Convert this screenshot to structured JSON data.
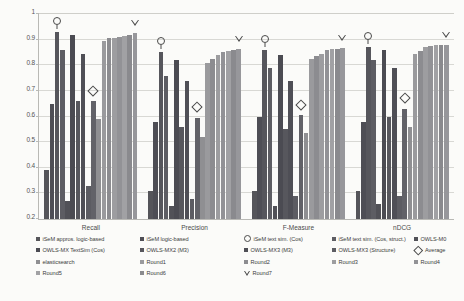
{
  "chart_data": {
    "type": "bar",
    "title": "",
    "xlabel": "",
    "ylabel": "",
    "ylim": [
      0.2,
      1
    ],
    "yticks": [
      "0.2",
      "0.3",
      "0.4",
      "0.5",
      "0.6",
      "0.7",
      "0.8",
      "0.9",
      "1"
    ],
    "grid": true,
    "legend_position": "bottom",
    "categories": [
      "Recall",
      "Precision",
      "F-Measure",
      "nDCG"
    ],
    "series": [
      {
        "name": "iSeM appros. logic-based",
        "color": "#55555a",
        "marker": "bar",
        "values": [
          0.39,
          0.31,
          0.31,
          0.31
        ]
      },
      {
        "name": "iSeM logic-based",
        "color": "#4e4e55",
        "marker": "bar",
        "values": [
          0.65,
          0.58,
          0.6,
          0.58
        ]
      },
      {
        "name": "iSeM text sim. (Cos)",
        "color": "#56565c",
        "marker": "circle",
        "values": [
          0.93,
          0.85,
          0.86,
          0.87
        ]
      },
      {
        "name": "iSeM text sim. (Cos, struct.)",
        "color": "#5d5d63",
        "marker": "bar",
        "values": [
          0.86,
          0.76,
          0.79,
          0.82
        ]
      },
      {
        "name": "OWLS-M0",
        "color": "#515157",
        "marker": "bar",
        "values": [
          0.27,
          0.25,
          0.25,
          0.26
        ]
      },
      {
        "name": "OWLS-MX TextSim (Cos)",
        "color": "#4b4b52",
        "marker": "bar",
        "values": [
          0.92,
          0.82,
          0.84,
          0.86
        ]
      },
      {
        "name": "OWLS-MX2 (M3)",
        "color": "#57575d",
        "marker": "bar",
        "values": [
          0.66,
          0.56,
          0.55,
          0.6
        ]
      },
      {
        "name": "OWLS-MX3 (M3)",
        "color": "#4f4f56",
        "marker": "bar",
        "values": [
          0.845,
          0.74,
          0.74,
          0.79
        ]
      },
      {
        "name": "OWLS-MX3 (Structure)",
        "color": "#5c5c62",
        "marker": "bar",
        "values": [
          0.33,
          0.28,
          0.29,
          0.29
        ]
      },
      {
        "name": "Average",
        "color": "#626268",
        "marker": "diamond",
        "values": [
          0.66,
          0.595,
          0.605,
          0.63
        ]
      },
      {
        "name": "elasticsearch",
        "color": "#8f8f92",
        "marker": "bar",
        "values": [
          0.59,
          0.52,
          0.535,
          0.56
        ]
      },
      {
        "name": "Round1",
        "color": "#9a9a9d",
        "marker": "bar",
        "values": [
          0.895,
          0.81,
          0.825,
          0.845
        ]
      },
      {
        "name": "Round2",
        "color": "#8c8c90",
        "marker": "bar",
        "values": [
          0.905,
          0.825,
          0.835,
          0.855
        ]
      },
      {
        "name": "Round3",
        "color": "#9d9da0",
        "marker": "bar",
        "values": [
          0.908,
          0.84,
          0.845,
          0.87
        ]
      },
      {
        "name": "Round4",
        "color": "#929296",
        "marker": "bar",
        "values": [
          0.912,
          0.85,
          0.858,
          0.875
        ]
      },
      {
        "name": "Round5",
        "color": "#a1a1a4",
        "marker": "bar",
        "values": [
          0.915,
          0.855,
          0.862,
          0.878
        ]
      },
      {
        "name": "Round6",
        "color": "#8a8a8e",
        "marker": "bar",
        "values": [
          0.918,
          0.858,
          0.865,
          0.878
        ]
      },
      {
        "name": "Round7",
        "color": "#97979b",
        "marker": "triangle",
        "values": [
          0.925,
          0.862,
          0.868,
          0.88
        ]
      }
    ]
  },
  "legend": {
    "rows": [
      [
        {
          "label": "iSeM appros. logic-based",
          "swatch": "square",
          "color": "#55555a"
        },
        {
          "label": "iSeM logic-based",
          "swatch": "square",
          "color": "#4e4e55"
        },
        {
          "label": "iSeM text sim. (Cos)",
          "swatch": "circle",
          "color": "#56565c"
        },
        {
          "label": "iSeM text sim. (Cos, struct.)",
          "swatch": "square",
          "color": "#5d5d63"
        },
        {
          "label": "OWLS-M0",
          "swatch": "square",
          "color": "#515157"
        }
      ],
      [
        {
          "label": "OWLS-MX TextSim (Cos)",
          "swatch": "square",
          "color": "#4b4b52"
        },
        {
          "label": "OWLS-MX2 (M3)",
          "swatch": "square",
          "color": "#57575d"
        },
        {
          "label": "OWLS-MX3 (M3)",
          "swatch": "square",
          "color": "#4f4f56"
        },
        {
          "label": "OWLS-MX3 (Structure)",
          "swatch": "square",
          "color": "#5c5c62"
        },
        {
          "label": "Average",
          "swatch": "diamond",
          "color": "#626268"
        }
      ],
      [
        {
          "label": "elasticsearch",
          "swatch": "square",
          "color": "#8f8f92"
        },
        {
          "label": "Round1",
          "swatch": "square",
          "color": "#9a9a9d"
        },
        {
          "label": "Round2",
          "swatch": "square",
          "color": "#8c8c90"
        },
        {
          "label": "Round3",
          "swatch": "square",
          "color": "#9d9da0"
        },
        {
          "label": "Round4",
          "swatch": "square",
          "color": "#929296"
        }
      ],
      [
        {
          "label": "Round5",
          "swatch": "square",
          "color": "#a1a1a4"
        },
        {
          "label": "Round6",
          "swatch": "square",
          "color": "#8a8a8e"
        },
        {
          "label": "Round7",
          "swatch": "triangle",
          "color": "#97979b"
        }
      ]
    ]
  }
}
